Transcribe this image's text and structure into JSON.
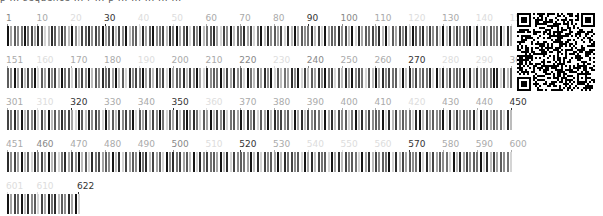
{
  "top_text_fragment": "p ... sequence ... r ... p ... ... ... ... ...",
  "layout": {
    "positions_per_row": 150,
    "px_per_position": 3.38,
    "total_length": 622
  },
  "colors": {
    "label_dark": "#333333",
    "label_medium": "#888888",
    "label_light": "#aaaaaa",
    "label_faint": "#dddddd"
  },
  "rows": [
    {
      "start": 1,
      "end": 150,
      "top": 13,
      "labels": [
        {
          "text": "1",
          "pos": 1,
          "shade": "medium"
        },
        {
          "text": "10",
          "pos": 10,
          "shade": "light"
        },
        {
          "text": "20",
          "pos": 20,
          "shade": "faint"
        },
        {
          "text": "30",
          "pos": 30,
          "shade": "dark"
        },
        {
          "text": "40",
          "pos": 40,
          "shade": "faint"
        },
        {
          "text": "50",
          "pos": 50,
          "shade": "faint"
        },
        {
          "text": "60",
          "pos": 60,
          "shade": "light"
        },
        {
          "text": "70",
          "pos": 70,
          "shade": "light"
        },
        {
          "text": "80",
          "pos": 80,
          "shade": "light"
        },
        {
          "text": "90",
          "pos": 90,
          "shade": "dark"
        },
        {
          "text": "100",
          "pos": 100,
          "shade": "medium"
        },
        {
          "text": "110",
          "pos": 110,
          "shade": "light"
        },
        {
          "text": "120",
          "pos": 120,
          "shade": "faint"
        },
        {
          "text": "130",
          "pos": 130,
          "shade": "light"
        },
        {
          "text": "140",
          "pos": 140,
          "shade": "faint"
        },
        {
          "text": "150",
          "pos": 150,
          "shade": "faint"
        }
      ],
      "bar_shades": "936459573861286385294176847593682749256183694572859368174925683174926583715928463718293645827193658472918365748291637482965837461928374659182736459183746528391746529381746592"
    },
    {
      "start": 151,
      "end": 300,
      "top": 55,
      "labels": [
        {
          "text": "151",
          "pos": 151,
          "shade": "light"
        },
        {
          "text": "160",
          "pos": 160,
          "shade": "faint"
        },
        {
          "text": "170",
          "pos": 170,
          "shade": "light"
        },
        {
          "text": "180",
          "pos": 180,
          "shade": "light"
        },
        {
          "text": "190",
          "pos": 190,
          "shade": "faint"
        },
        {
          "text": "200",
          "pos": 200,
          "shade": "light"
        },
        {
          "text": "210",
          "pos": 210,
          "shade": "light"
        },
        {
          "text": "220",
          "pos": 220,
          "shade": "medium"
        },
        {
          "text": "230",
          "pos": 230,
          "shade": "faint"
        },
        {
          "text": "240",
          "pos": 240,
          "shade": "medium"
        },
        {
          "text": "250",
          "pos": 250,
          "shade": "light"
        },
        {
          "text": "260",
          "pos": 260,
          "shade": "light"
        },
        {
          "text": "270",
          "pos": 270,
          "shade": "dark"
        },
        {
          "text": "280",
          "pos": 280,
          "shade": "faint"
        },
        {
          "text": "290",
          "pos": 290,
          "shade": "faint"
        },
        {
          "text": "300",
          "pos": 300,
          "shade": "light"
        }
      ],
      "bar_shades": "649382759163847295618374926485739261847593628471936582749318465927384619527384916253849172638495716283947516293847561928374658192837465918273645981726354891726354819273645819"
    },
    {
      "start": 301,
      "end": 450,
      "top": 97,
      "labels": [
        {
          "text": "301",
          "pos": 301,
          "shade": "light"
        },
        {
          "text": "310",
          "pos": 310,
          "shade": "faint"
        },
        {
          "text": "320",
          "pos": 320,
          "shade": "dark"
        },
        {
          "text": "330",
          "pos": 330,
          "shade": "light"
        },
        {
          "text": "340",
          "pos": 340,
          "shade": "light"
        },
        {
          "text": "350",
          "pos": 350,
          "shade": "dark"
        },
        {
          "text": "360",
          "pos": 360,
          "shade": "faint"
        },
        {
          "text": "370",
          "pos": 370,
          "shade": "light"
        },
        {
          "text": "380",
          "pos": 380,
          "shade": "light"
        },
        {
          "text": "390",
          "pos": 390,
          "shade": "light"
        },
        {
          "text": "400",
          "pos": 400,
          "shade": "light"
        },
        {
          "text": "410",
          "pos": 410,
          "shade": "light"
        },
        {
          "text": "420",
          "pos": 420,
          "shade": "faint"
        },
        {
          "text": "430",
          "pos": 430,
          "shade": "light"
        },
        {
          "text": "440",
          "pos": 440,
          "shade": "light"
        },
        {
          "text": "450",
          "pos": 450,
          "shade": "dark"
        }
      ],
      "bar_shades": "758392648173926485731962847519362847591638274951638279485163927481563928471639285746193827465193827461592837465918273645189273645918273645819273645182937465192837461928374651"
    },
    {
      "start": 451,
      "end": 600,
      "top": 139,
      "labels": [
        {
          "text": "451",
          "pos": 451,
          "shade": "light"
        },
        {
          "text": "460",
          "pos": 460,
          "shade": "medium"
        },
        {
          "text": "470",
          "pos": 470,
          "shade": "light"
        },
        {
          "text": "480",
          "pos": 480,
          "shade": "light"
        },
        {
          "text": "490",
          "pos": 490,
          "shade": "light"
        },
        {
          "text": "500",
          "pos": 500,
          "shade": "medium"
        },
        {
          "text": "510",
          "pos": 510,
          "shade": "faint"
        },
        {
          "text": "520",
          "pos": 520,
          "shade": "dark"
        },
        {
          "text": "530",
          "pos": 530,
          "shade": "light"
        },
        {
          "text": "540",
          "pos": 540,
          "shade": "faint"
        },
        {
          "text": "550",
          "pos": 550,
          "shade": "faint"
        },
        {
          "text": "560",
          "pos": 560,
          "shade": "faint"
        },
        {
          "text": "570",
          "pos": 570,
          "shade": "dark"
        },
        {
          "text": "580",
          "pos": 580,
          "shade": "light"
        },
        {
          "text": "590",
          "pos": 590,
          "shade": "light"
        },
        {
          "text": "600",
          "pos": 600,
          "shade": "light"
        }
      ],
      "bar_shades": "847392618473926158374926185736492817364958273619485736291847563928174653928174639285746193827561938274651938274659182736459182736451928374659182736451829374651928374659182736"
    },
    {
      "start": 601,
      "end": 622,
      "top": 181,
      "labels": [
        {
          "text": "601",
          "pos": 601,
          "shade": "faint"
        },
        {
          "text": "610",
          "pos": 610,
          "shade": "faint"
        },
        {
          "text": "622",
          "pos": 622,
          "shade": "dark"
        }
      ],
      "bar_shades": "9375928461739582648391"
    }
  ],
  "qr_code": {
    "label": "qr-code",
    "size_px": 78
  }
}
